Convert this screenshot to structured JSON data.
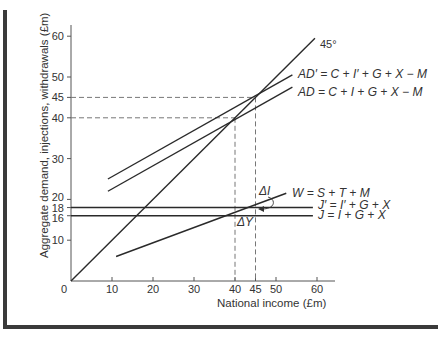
{
  "chart_data": {
    "type": "line",
    "title": "",
    "xlabel": "National income (£m)",
    "ylabel": "Aggregate demand, injections, withdrawals (£m)",
    "xlim": [
      0,
      64
    ],
    "ylim": [
      0,
      63
    ],
    "x_ticks": [
      0,
      10,
      20,
      30,
      40,
      45,
      50,
      60
    ],
    "x_tick_labels": [
      "0",
      "10",
      "20",
      "30",
      "40",
      "45",
      "50",
      "60"
    ],
    "y_ticks": [
      10,
      16,
      18,
      20,
      30,
      40,
      45,
      50,
      60
    ],
    "y_tick_labels": [
      "10",
      "16",
      "18",
      "20",
      "30",
      "40",
      "45",
      "50",
      "60"
    ],
    "grid": false,
    "series": [
      {
        "name": "45°",
        "label": "45°",
        "x": [
          0,
          59.5
        ],
        "y": [
          0,
          59.5
        ]
      },
      {
        "name": "AD'",
        "label": "AD′ = C + I′ + G + X − M",
        "x": [
          9,
          54
        ],
        "y": [
          25,
          50.5
        ]
      },
      {
        "name": "AD",
        "label": "AD = C + I + G + X − M",
        "x": [
          9,
          54
        ],
        "y": [
          22,
          47.5
        ]
      },
      {
        "name": "W",
        "label": "W = S + T + M",
        "x": [
          11,
          52.5
        ],
        "y": [
          6,
          21.5
        ]
      },
      {
        "name": "J'",
        "label": "J′ = I′ + G + X",
        "x": [
          0,
          59
        ],
        "y": [
          18,
          18
        ]
      },
      {
        "name": "J",
        "label": "J = I + G + X",
        "x": [
          0,
          59
        ],
        "y": [
          16,
          16
        ]
      }
    ],
    "equilibria": [
      {
        "x": 40,
        "y": 40,
        "description": "AD meets 45° line"
      },
      {
        "x": 45,
        "y": 45,
        "description": "AD′ meets 45° line"
      }
    ],
    "annotations": [
      {
        "text": "ΔI",
        "description": "shift from J to J′, curved arrow"
      },
      {
        "text": "ΔY",
        "description": "change in national income 40 → 45"
      }
    ],
    "reference_lines": [
      {
        "type": "horizontal-dashed",
        "y": 45,
        "x_to": 45
      },
      {
        "type": "horizontal-dashed",
        "y": 40,
        "x_to": 40
      },
      {
        "type": "vertical-dashed",
        "x": 40,
        "y_to": 40
      },
      {
        "type": "vertical-dashed",
        "x": 45,
        "y_to": 45
      }
    ]
  },
  "labels": {
    "origin": "0",
    "x_axis_title": "National income (£m)",
    "y_axis_title": "Aggregate demand, injections, withdrawals (£m)",
    "line_45": "45°",
    "ad_prime": "AD′ = C + I′ + G + X − M",
    "ad": "AD = C + I + G + X − M",
    "w": "W = S + T + M",
    "j_prime": "J′ = I′ + G + X",
    "j": "J = I + G + X",
    "delta_i": "ΔI",
    "delta_y": "ΔY"
  }
}
